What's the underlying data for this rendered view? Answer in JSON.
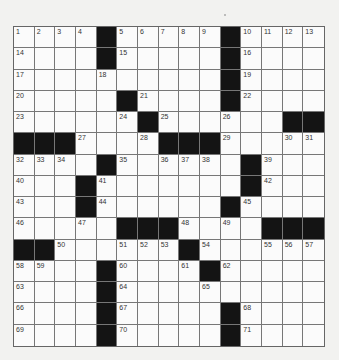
{
  "puzzle": {
    "rows": 15,
    "cols": 15,
    "colors": {
      "background": "#f2f2f0",
      "cell": "#fbfbfb",
      "block": "#141414",
      "grid_line": "#777777",
      "number": "#333333"
    },
    "grid": [
      [
        "1",
        "2",
        "3",
        "4",
        "#",
        "5",
        "6",
        "7",
        "8",
        "9",
        "#",
        "10",
        "11",
        "12",
        "13"
      ],
      [
        "14",
        "",
        "",
        "",
        "#",
        "15",
        "",
        "",
        "",
        "",
        "#",
        "16",
        "",
        "",
        ""
      ],
      [
        "17",
        "",
        "",
        "",
        "18",
        "",
        "",
        "",
        "",
        "",
        "#",
        "19",
        "",
        "",
        ""
      ],
      [
        "20",
        "",
        "",
        "",
        "",
        "#",
        "21",
        "",
        "",
        "",
        "#",
        "22",
        "",
        "",
        ""
      ],
      [
        "23",
        "",
        "",
        "",
        "",
        "24",
        "#",
        "25",
        "",
        "",
        "26",
        "",
        "",
        "#",
        "#"
      ],
      [
        "#",
        "#",
        "#",
        "27",
        "",
        "",
        "28",
        "#",
        "#",
        "#",
        "29",
        "",
        "",
        "30",
        "31"
      ],
      [
        "32",
        "33",
        "34",
        "",
        "#",
        "35",
        "",
        "36",
        "37",
        "38",
        "",
        "#",
        "39",
        "",
        ""
      ],
      [
        "40",
        "",
        "",
        "#",
        "41",
        "",
        "",
        "",
        "",
        "",
        "",
        "#",
        "42",
        "",
        ""
      ],
      [
        "43",
        "",
        "",
        "#",
        "44",
        "",
        "",
        "",
        "",
        "",
        "#",
        "45",
        "",
        "",
        ""
      ],
      [
        "46",
        "",
        "",
        "47",
        "",
        "#",
        "#",
        "#",
        "48",
        "",
        "49",
        "",
        "#",
        "#",
        "#"
      ],
      [
        "#",
        "#",
        "50",
        "",
        "",
        "51",
        "52",
        "53",
        "#",
        "54",
        "",
        "",
        "55",
        "56",
        "57"
      ],
      [
        "58",
        "59",
        "",
        "",
        "#",
        "60",
        "",
        "",
        "61",
        "#",
        "62",
        "",
        "",
        "",
        ""
      ],
      [
        "63",
        "",
        "",
        "",
        "#",
        "64",
        "",
        "",
        "",
        "65",
        "",
        "",
        "",
        "",
        ""
      ],
      [
        "66",
        "",
        "",
        "",
        "#",
        "67",
        "",
        "",
        "",
        "",
        "#",
        "68",
        "",
        "",
        ""
      ],
      [
        "69",
        "",
        "",
        "",
        "#",
        "70",
        "",
        "",
        "",
        "",
        "#",
        "71",
        "",
        "",
        ""
      ]
    ]
  }
}
